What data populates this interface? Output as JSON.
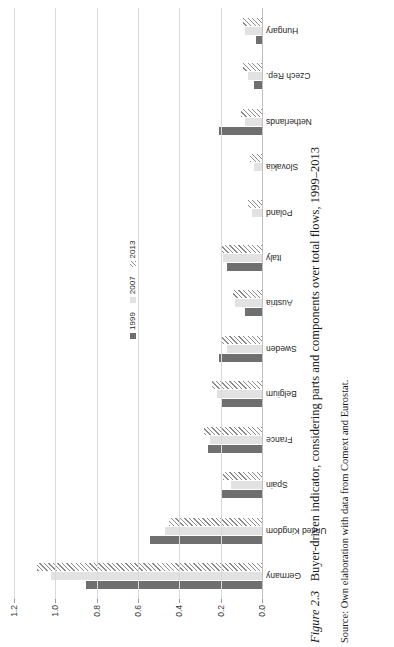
{
  "figure": {
    "number_label": "Figure 2.3",
    "caption_text": "Buyer-driven indicator, considering parts and components over total flows, 1999–2013",
    "source_line": "Source: Own elaboration with data from Comext and Eurostat."
  },
  "legend": {
    "items": [
      {
        "label": "1999",
        "style": "solid-dark",
        "color": "#6f6f6f"
      },
      {
        "label": "2007",
        "style": "solid-light",
        "color": "#e2e2e2"
      },
      {
        "label": "2013",
        "style": "hatched",
        "color": "#8a8a8a"
      }
    ]
  },
  "axis": {
    "ticks": [
      "0.0",
      "0.2",
      "0.4",
      "0.6",
      "0.8",
      "1.0",
      "1.2"
    ],
    "min": 0.0,
    "max": 1.2,
    "grid": true
  },
  "chart_data": {
    "type": "bar",
    "orientation": "horizontal",
    "title": "Buyer-driven indicator, considering parts and components over total flows, 1999–2013",
    "xlabel": "",
    "ylabel": "",
    "ylim": [
      0.0,
      1.2
    ],
    "grid": true,
    "legend_position": "inside-center-right",
    "categories": [
      "Germany",
      "United Kingdom",
      "Spain",
      "France",
      "Belgium",
      "Sweden",
      "Austria",
      "Italy",
      "Poland",
      "Slovakia",
      "Netherlands",
      "Czech Rep.",
      "Hungary"
    ],
    "series": [
      {
        "name": "1999",
        "values": [
          0.85,
          0.54,
          0.2,
          0.26,
          0.2,
          0.21,
          0.08,
          0.17,
          0.0,
          0.0,
          0.21,
          0.04,
          0.03
        ]
      },
      {
        "name": "2007",
        "values": [
          1.02,
          0.47,
          0.15,
          0.25,
          0.22,
          0.17,
          0.13,
          0.19,
          0.05,
          0.04,
          0.08,
          0.07,
          0.08
        ]
      },
      {
        "name": "2013",
        "values": [
          1.09,
          0.45,
          0.19,
          0.28,
          0.24,
          0.2,
          0.14,
          0.2,
          0.07,
          0.06,
          0.1,
          0.09,
          0.09
        ]
      }
    ]
  }
}
